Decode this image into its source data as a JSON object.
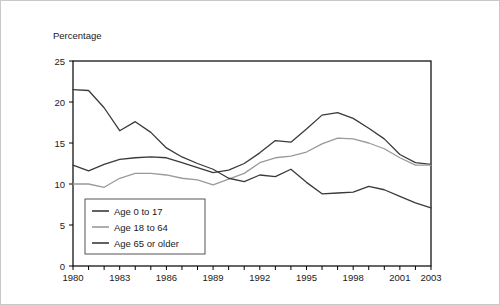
{
  "chart_data": {
    "type": "line",
    "title": "",
    "subtitle": "",
    "ylabel": "Percentage",
    "xlabel": "",
    "ylim": [
      0,
      25
    ],
    "xlim": [
      1980,
      2003
    ],
    "yticks": [
      0,
      5,
      10,
      15,
      20,
      25
    ],
    "ytick_labels": [
      "0",
      "5",
      "10",
      "15",
      "20",
      "25"
    ],
    "xticks": [
      1980,
      1981,
      1982,
      1983,
      1984,
      1985,
      1986,
      1987,
      1988,
      1989,
      1990,
      1991,
      1992,
      1993,
      1994,
      1995,
      1996,
      1997,
      1998,
      1999,
      2000,
      2001,
      2002,
      2003
    ],
    "xtick_labels_shown": [
      "1980",
      "1983",
      "1986",
      "1989",
      "1992",
      "1995",
      "1998",
      "2001",
      "2003"
    ],
    "xtick_label_years": [
      1980,
      1983,
      1986,
      1989,
      1992,
      1995,
      1998,
      2001,
      2003
    ],
    "grid": false,
    "legend_position": "lower-left-inside",
    "x": [
      1980,
      1981,
      1982,
      1983,
      1984,
      1985,
      1986,
      1987,
      1988,
      1989,
      1990,
      1991,
      1992,
      1993,
      1994,
      1995,
      1996,
      1997,
      1998,
      1999,
      2000,
      2001,
      2002,
      2003
    ],
    "series": [
      {
        "name": "Age 0 to 17",
        "color": "#3a3a3a",
        "values": [
          12.3,
          11.6,
          12.4,
          13.0,
          13.2,
          13.3,
          13.2,
          12.6,
          12.0,
          11.4,
          11.7,
          12.5,
          13.8,
          15.3,
          15.1,
          16.7,
          18.4,
          18.7,
          18.0,
          16.8,
          15.5,
          13.6,
          12.6,
          12.4
        ]
      },
      {
        "name": "Age 18 to 64",
        "color": "#9a9a9a",
        "values": [
          10.0,
          10.0,
          9.6,
          10.7,
          11.3,
          11.3,
          11.1,
          10.7,
          10.5,
          9.9,
          10.6,
          11.3,
          12.6,
          13.2,
          13.4,
          13.9,
          14.9,
          15.6,
          15.5,
          15.0,
          14.3,
          13.2,
          12.3,
          12.3
        ]
      },
      {
        "name": "Age 65 or older",
        "color": "#3a3a3a",
        "values": [
          21.5,
          21.4,
          19.3,
          16.5,
          17.6,
          16.3,
          14.4,
          13.3,
          12.5,
          11.8,
          10.7,
          10.3,
          11.1,
          10.9,
          11.8,
          10.2,
          8.8,
          8.9,
          9.0,
          9.7,
          9.3,
          8.5,
          7.7,
          7.1
        ]
      }
    ],
    "legend_entries": [
      "Age 0 to 17",
      "Age 18 to 64",
      "Age 65 or older"
    ]
  },
  "legend": {
    "item0": "Age 0 to 17",
    "item1": "Age 18 to 64",
    "item2": "Age 65 or older"
  },
  "axis": {
    "ylabel": "Percentage"
  }
}
